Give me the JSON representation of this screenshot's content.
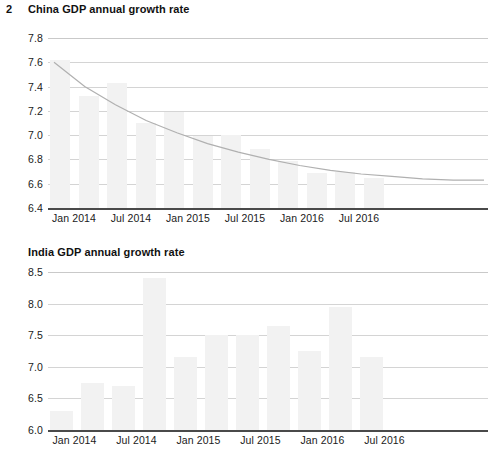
{
  "page": {
    "number": "2"
  },
  "figures": [
    {
      "title": "China GDP annual growth rate",
      "id": "china-gdp-chart"
    },
    {
      "title": "India GDP annual growth rate",
      "id": "india-gdp-chart"
    }
  ],
  "chart_data": [
    {
      "type": "bar",
      "title": "China GDP annual growth rate",
      "xlabel": "",
      "ylabel": "",
      "ylim": [
        6.4,
        7.8
      ],
      "yticks": [
        "6.4",
        "6.6",
        "6.8",
        "7.0",
        "7.2",
        "7.4",
        "7.6",
        "7.8"
      ],
      "ytick_values": [
        6.4,
        6.6,
        6.8,
        7.0,
        7.2,
        7.4,
        7.6,
        7.8
      ],
      "xticks": [
        "Jan 2014",
        "Jul 2014",
        "Jan 2015",
        "Jul 2015",
        "Jan 2016",
        "Jul 2016"
      ],
      "xtick_index": [
        0,
        2,
        4,
        6,
        8,
        10
      ],
      "grid": true,
      "legend": "none",
      "bar_color": "#f2f2f2",
      "series": [
        {
          "name": "China GDP annual growth rate",
          "values": [
            7.62,
            7.32,
            7.43,
            7.1,
            7.19,
            6.99,
            7.0,
            6.89,
            6.79,
            6.69,
            6.7,
            6.65
          ]
        }
      ],
      "overlay": {
        "type": "line",
        "name": "trend",
        "color": "#b0b0b0",
        "values": [
          7.6,
          7.4,
          7.25,
          7.12,
          7.02,
          6.93,
          6.86,
          6.8,
          6.75,
          6.71,
          6.68,
          6.66,
          6.64,
          6.63,
          6.63
        ]
      }
    },
    {
      "type": "bar",
      "title": "India GDP annual growth rate",
      "xlabel": "",
      "ylabel": "",
      "ylim": [
        6.0,
        8.5
      ],
      "yticks": [
        "6.0",
        "6.5",
        "7.0",
        "7.5",
        "8.0",
        "8.5"
      ],
      "ytick_values": [
        6.0,
        6.5,
        7.0,
        7.5,
        8.0,
        8.5
      ],
      "xticks": [
        "Jan 2014",
        "Jul 2014",
        "Jan 2015",
        "Jul 2015",
        "Jan 2016",
        "Jul 2016"
      ],
      "xtick_index": [
        0,
        2,
        4,
        6,
        8,
        10
      ],
      "grid": true,
      "legend": "none",
      "bar_color": "#f2f2f2",
      "series": [
        {
          "name": "India GDP annual growth rate",
          "values": [
            6.3,
            6.75,
            6.7,
            8.4,
            7.15,
            7.5,
            7.5,
            7.65,
            7.25,
            7.95,
            7.15
          ]
        }
      ]
    }
  ]
}
